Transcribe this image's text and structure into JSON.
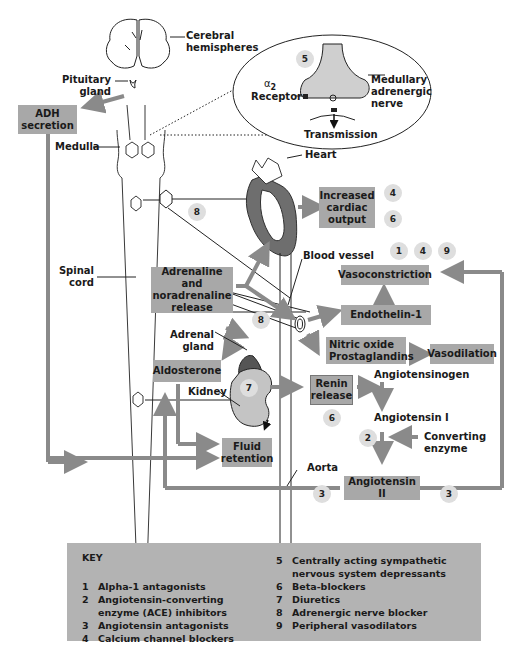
{
  "diagram": {
    "labels": {
      "cerebral_hemispheres": "Cerebral\nhemispheres",
      "pituitary_gland": "Pituitary\ngland",
      "medulla": "Medulla",
      "spinal_cord": "Spinal\ncord",
      "heart": "Heart",
      "blood_vessel": "Blood vessel",
      "adrenal_gland": "Adrenal\ngland",
      "kidney": "Kidney",
      "aorta": "Aorta",
      "alpha2_receptor_symbol": "α",
      "alpha2_receptor_sub": "2",
      "alpha2_receptor": "Receptor",
      "medullary_nerve": "Medullary\nadrenergic\nnerve",
      "transmission": "Transmission",
      "angiotensinogen": "Angiotensinogen",
      "angiotensin_i": "Angiotensin I",
      "converting_enzyme": "Converting\nenzyme"
    },
    "boxes": {
      "adh_secretion": "ADH\nsecretion",
      "increased_cardiac_output": "Increased\ncardiac\noutput",
      "vasoconstriction": "Vasoconstriction",
      "adrenaline_release": "Adrenaline and\nnoradrenaline\nrelease",
      "endothelin": "Endothelin-1",
      "nitric_oxide": "Nitric oxide\nProstaglandins",
      "vasodilation": "Vasodilation",
      "aldosterone": "Aldosterone",
      "renin_release": "Renin\nrelease",
      "fluid_retention": "Fluid\nretention",
      "angiotensin_ii": "Angiotensin II"
    },
    "markers": {
      "medulla_5": "5",
      "cardiac_4": "4",
      "cardiac_6": "6",
      "vaso_1": "1",
      "vaso_4": "4",
      "vaso_9": "9",
      "nerve_8": "8",
      "adrenal_8": "8",
      "kidney_7": "7",
      "renin_6": "6",
      "ace_2": "2",
      "angii_3_left": "3",
      "angii_3_right": "3"
    },
    "colors": {
      "box_fill": "#a8a8a8",
      "arrow": "#8a8a8a",
      "marker_fill": "#dedede",
      "key_fill": "#b3b3b3",
      "organ_dark": "#5a5a5a",
      "organ_light": "#c8c8c8"
    }
  },
  "key": {
    "title": "KEY",
    "items": [
      {
        "n": "1",
        "text": "Alpha-1 antagonists"
      },
      {
        "n": "2",
        "text": "Angiotensin-converting\nenzyme (ACE) inhibitors"
      },
      {
        "n": "3",
        "text": "Angiotensin antagonists"
      },
      {
        "n": "4",
        "text": "Calcium channel blockers"
      },
      {
        "n": "5",
        "text": "Centrally acting sympathetic\nnervous system depressants"
      },
      {
        "n": "6",
        "text": "Beta-blockers"
      },
      {
        "n": "7",
        "text": "Diuretics"
      },
      {
        "n": "8",
        "text": "Adrenergic nerve blocker"
      },
      {
        "n": "9",
        "text": "Peripheral vasodilators"
      }
    ]
  }
}
